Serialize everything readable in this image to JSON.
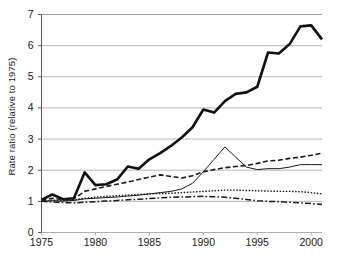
{
  "chart_data": {
    "type": "line",
    "title": "",
    "subtitle": "",
    "xlabel": "",
    "ylabel": "Rate ratio (relative to 1975)",
    "xlim": [
      1975,
      2001
    ],
    "ylim": [
      0,
      7
    ],
    "yticks": [
      0,
      1,
      2,
      3,
      4,
      5,
      6,
      7
    ],
    "ytick_labels": [
      "0",
      "1",
      "2",
      "3",
      "4",
      "5",
      "6",
      "7"
    ],
    "xticks": [
      1975,
      1980,
      1985,
      1990,
      1995,
      2000
    ],
    "xtick_labels": [
      "1975",
      "1980",
      "1985",
      "1990",
      "1995",
      "2000"
    ],
    "grid": "horizontal",
    "legend": "none",
    "x": [
      1975,
      1976,
      1977,
      1978,
      1979,
      1980,
      1981,
      1982,
      1983,
      1984,
      1985,
      1986,
      1987,
      1988,
      1989,
      1990,
      1991,
      1992,
      1993,
      1994,
      1995,
      1996,
      1997,
      1998,
      1999,
      2000,
      2001
    ],
    "series": [
      {
        "name": "series-thick-solid",
        "style": "solid-thick",
        "color": "#111111",
        "width": 2.6,
        "values": [
          1.05,
          1.22,
          1.07,
          1.1,
          1.93,
          1.52,
          1.55,
          1.7,
          2.12,
          2.05,
          2.35,
          2.55,
          2.78,
          3.05,
          3.38,
          3.95,
          3.85,
          4.22,
          4.45,
          4.5,
          4.68,
          5.78,
          5.75,
          6.05,
          6.62,
          6.65,
          6.2
        ]
      },
      {
        "name": "series-dashed",
        "style": "dashed",
        "color": "#1a1a1a",
        "width": 1.6,
        "values": [
          1.02,
          1.1,
          1.05,
          1.08,
          1.32,
          1.4,
          1.48,
          1.55,
          1.62,
          1.7,
          1.78,
          1.85,
          1.8,
          1.75,
          1.82,
          1.95,
          2.02,
          2.08,
          2.12,
          2.15,
          2.22,
          2.3,
          2.32,
          2.38,
          2.42,
          2.48,
          2.55
        ]
      },
      {
        "name": "series-thin-solid",
        "style": "solid-thin",
        "color": "#1a1a1a",
        "width": 1.0,
        "values": [
          1.0,
          1.02,
          1.01,
          1.03,
          1.08,
          1.1,
          1.12,
          1.14,
          1.17,
          1.2,
          1.24,
          1.28,
          1.32,
          1.4,
          1.58,
          1.95,
          2.35,
          2.75,
          2.42,
          2.1,
          2.02,
          2.05,
          2.05,
          2.1,
          2.18,
          2.18,
          2.18
        ]
      },
      {
        "name": "series-dotted",
        "style": "dotted",
        "color": "#1a1a1a",
        "width": 1.4,
        "values": [
          1.0,
          1.04,
          1.02,
          1.04,
          1.1,
          1.13,
          1.16,
          1.18,
          1.2,
          1.22,
          1.24,
          1.25,
          1.26,
          1.28,
          1.3,
          1.32,
          1.34,
          1.36,
          1.36,
          1.35,
          1.34,
          1.33,
          1.32,
          1.32,
          1.31,
          1.28,
          1.24
        ]
      },
      {
        "name": "series-dash-dot",
        "style": "dash-dot",
        "color": "#1a1a1a",
        "width": 1.5,
        "values": [
          1.0,
          0.98,
          0.96,
          0.95,
          0.97,
          0.99,
          1.01,
          1.03,
          1.05,
          1.07,
          1.09,
          1.11,
          1.13,
          1.14,
          1.15,
          1.16,
          1.15,
          1.13,
          1.1,
          1.06,
          1.02,
          1.0,
          0.99,
          0.97,
          0.95,
          0.93,
          0.9
        ]
      }
    ]
  }
}
